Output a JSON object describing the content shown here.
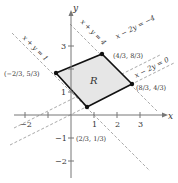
{
  "diagram": {
    "region_label": "R",
    "axes": {
      "x_label": "x",
      "y_label": "y"
    },
    "x_ticks": [
      {
        "value": -2,
        "label": "−2"
      },
      {
        "value": 1,
        "label": "1"
      },
      {
        "value": 2,
        "label": "2"
      },
      {
        "value": 3,
        "label": "3"
      }
    ],
    "y_ticks": [
      {
        "value": 3,
        "label": "3"
      },
      {
        "value": 1,
        "label": "1"
      },
      {
        "value": -1,
        "label": "−1"
      },
      {
        "value": -2,
        "label": "−2"
      }
    ],
    "lines": [
      {
        "equation": "x + y = 1"
      },
      {
        "equation": "x + y = 4"
      },
      {
        "equation": "x − 2y = −4"
      },
      {
        "equation": "x − 2y = 0"
      }
    ],
    "vertices": [
      {
        "x": "−2/3",
        "y": "5/3",
        "label": "(−2/3, 5/3)"
      },
      {
        "x": "4/3",
        "y": "8/3",
        "label": "(4/3, 8/3)"
      },
      {
        "x": "8/3",
        "y": "4/3",
        "label": "(8/3, 4/3)"
      },
      {
        "x": "2/3",
        "y": "1/3",
        "label": "(2/3, 1/3)"
      }
    ],
    "colors": {
      "region_fill": "#e6e6e6",
      "boundary": "#111111",
      "dashed": "#aaaaaa",
      "axis": "#777777"
    }
  }
}
